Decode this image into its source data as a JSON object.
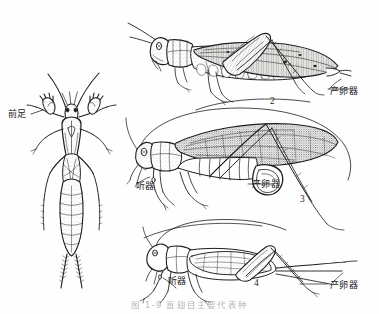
{
  "figure": {
    "caption": "图 1-9  直翅目主要代表种",
    "background_color": "#fefefe",
    "ink_color": "#1f1d1b",
    "width": 379,
    "height": 314
  },
  "labels": {
    "foreleg": "前足",
    "ovipositor": "产卵器",
    "tympanum": "听器"
  },
  "numerals": {
    "locust": "2",
    "katydid": "3",
    "cricket": "4"
  },
  "specimens": [
    {
      "id": "mole-cricket",
      "name": "mole-cricket-dorsal-view",
      "view": "dorsal",
      "callouts": [
        "前足"
      ]
    },
    {
      "id": "locust",
      "name": "locust-lateral-view",
      "numeral": "2",
      "view": "lateral",
      "callouts": [
        "产卵器"
      ]
    },
    {
      "id": "katydid",
      "name": "katydid-lateral-view",
      "numeral": "3",
      "view": "lateral",
      "callouts": [
        "听器",
        "产卵器"
      ]
    },
    {
      "id": "cricket",
      "name": "cricket-lateral-view",
      "numeral": "4",
      "view": "lateral",
      "callouts": [
        "听器",
        "产卵器"
      ]
    }
  ]
}
